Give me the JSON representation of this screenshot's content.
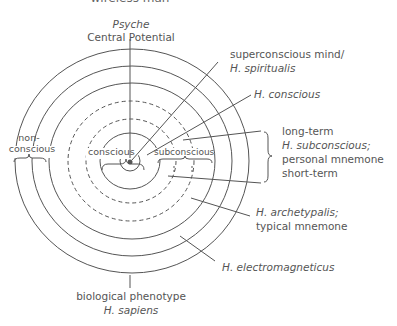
{
  "title": "wireless man",
  "top_label": {
    "line1": "Psyche",
    "line2": "Central Potential"
  },
  "right_labels": {
    "superconscious": {
      "line1": "superconscious mind/",
      "line2": "H. spiritualis"
    },
    "conscious": "H. conscious",
    "subconscious": {
      "long_term": "long-term",
      "line2": "H. subconscious;",
      "line3": "personal mnemone",
      "short_term": "short-term"
    },
    "archetypalis": {
      "line1": "H. archetypalis;",
      "line2": "typical mnemone"
    },
    "electromagneticus": "H. electromagneticus"
  },
  "bottom_label": {
    "line1": "biological phenotype",
    "line2": "H. sapiens"
  },
  "inner_labels": {
    "nonconscious": {
      "line1": "non-",
      "line2": "conscious"
    },
    "conscious": "conscious",
    "subconscious": "subconscious"
  },
  "colors": {
    "line": "#555555",
    "text": "#555555",
    "background": "#ffffff"
  }
}
